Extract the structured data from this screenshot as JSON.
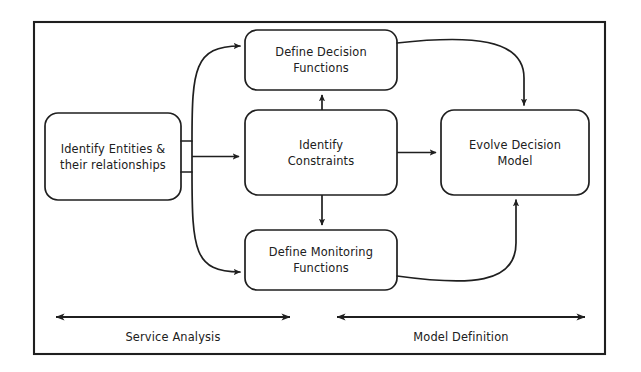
{
  "diagram": {
    "background_color": "#ffffff",
    "stroke_color": "#1f1f1f",
    "frame": {
      "x": 34,
      "y": 22,
      "width": 571,
      "height": 332
    },
    "nodes": [
      {
        "id": "identify-entities",
        "lines": [
          "Identify Entities &",
          "their relationships"
        ],
        "line1": "Identify Entities &",
        "line2": "their relationships",
        "x": 45,
        "y": 113,
        "width": 136,
        "height": 87
      },
      {
        "id": "define-decision-functions",
        "lines": [
          "Define Decision",
          "Functions"
        ],
        "line1": "Define Decision",
        "line2": "Functions",
        "x": 245,
        "y": 30,
        "width": 152,
        "height": 60
      },
      {
        "id": "identify-constraints",
        "lines": [
          "Identify",
          "Constraints"
        ],
        "line1": "Identify",
        "line2": "Constraints",
        "x": 245,
        "y": 110,
        "width": 152,
        "height": 85
      },
      {
        "id": "define-monitoring-functions",
        "lines": [
          "Define Monitoring",
          "Functions"
        ],
        "line1": "Define Monitoring",
        "line2": "Functions",
        "x": 245,
        "y": 230,
        "width": 152,
        "height": 60
      },
      {
        "id": "evolve-decision-model",
        "lines": [
          "Evolve Decision",
          "Model"
        ],
        "line1": "Evolve Decision",
        "line2": "Model",
        "x": 441,
        "y": 110,
        "width": 148,
        "height": 85
      }
    ],
    "phases": [
      {
        "id": "service-analysis",
        "label": "Service Analysis",
        "arrow_x1": 56,
        "arrow_x2": 290,
        "arrow_y": 317,
        "label_x": 56,
        "label_width": 234,
        "label_y": 330
      },
      {
        "id": "model-definition",
        "label": "Model Definition",
        "arrow_x1": 337,
        "arrow_x2": 585,
        "arrow_y": 317,
        "label_x": 337,
        "label_width": 248,
        "label_y": 330
      }
    ],
    "connectors": [
      {
        "id": "entities-to-constraints",
        "from": "identify-entities",
        "to": "identify-constraints",
        "kind": "straight-right"
      },
      {
        "id": "entities-to-decision-functions",
        "from": "identify-entities",
        "to": "define-decision-functions",
        "kind": "curve-up"
      },
      {
        "id": "entities-to-monitoring-functions",
        "from": "identify-entities",
        "to": "define-monitoring-functions",
        "kind": "curve-down"
      },
      {
        "id": "constraints-to-decision-functions",
        "from": "identify-constraints",
        "to": "define-decision-functions",
        "kind": "straight-up"
      },
      {
        "id": "constraints-to-monitoring-functions",
        "from": "identify-constraints",
        "to": "define-monitoring-functions",
        "kind": "straight-down"
      },
      {
        "id": "constraints-to-evolve-model",
        "from": "identify-constraints",
        "to": "evolve-decision-model",
        "kind": "straight-right"
      },
      {
        "id": "decision-functions-to-evolve-model",
        "from": "define-decision-functions",
        "to": "evolve-decision-model",
        "kind": "curve-over-right"
      },
      {
        "id": "monitoring-functions-to-evolve-model",
        "from": "define-monitoring-functions",
        "to": "evolve-decision-model",
        "kind": "curve-under-right"
      }
    ]
  }
}
